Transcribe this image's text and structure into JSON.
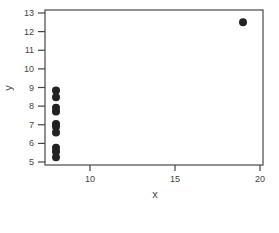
{
  "chart_data": {
    "type": "scatter",
    "title": "",
    "xlabel": "x",
    "ylabel": "y",
    "xlim": [
      7.3,
      20.2
    ],
    "ylim": [
      4.85,
      13.2
    ],
    "xticks": [
      10,
      15,
      20
    ],
    "yticks": [
      5,
      6,
      7,
      8,
      9,
      10,
      11,
      12,
      13
    ],
    "grid": false,
    "legend": null,
    "points": [
      {
        "x": 8,
        "y": 6.58
      },
      {
        "x": 8,
        "y": 5.76
      },
      {
        "x": 8,
        "y": 7.71
      },
      {
        "x": 8,
        "y": 8.84
      },
      {
        "x": 8,
        "y": 8.47
      },
      {
        "x": 8,
        "y": 7.04
      },
      {
        "x": 8,
        "y": 5.25
      },
      {
        "x": 19,
        "y": 12.5
      },
      {
        "x": 8,
        "y": 5.56
      },
      {
        "x": 8,
        "y": 7.91
      },
      {
        "x": 8,
        "y": 6.89
      }
    ],
    "marker_color": "#222222",
    "axis_color": "#444444"
  }
}
